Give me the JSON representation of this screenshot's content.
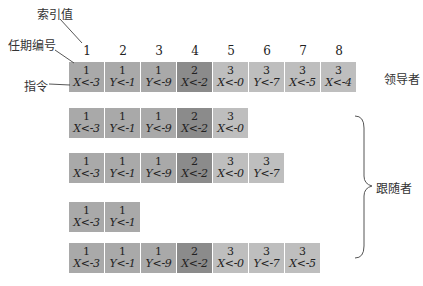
{
  "annotations": {
    "index_label": "索引值",
    "term_label": "任期编号",
    "command_label": "指令",
    "leader_label": "领导者",
    "followers_label": "跟随者"
  },
  "indices": [
    "1",
    "2",
    "3",
    "4",
    "5",
    "6",
    "7",
    "8"
  ],
  "term_colors": {
    "1": "#a9a9a9",
    "2": "#8b8b8b",
    "3": "#bebebe"
  },
  "logs": {
    "leader": [
      {
        "term": "1",
        "cmd": "X<-3"
      },
      {
        "term": "1",
        "cmd": "Y<-1"
      },
      {
        "term": "1",
        "cmd": "Y<-9"
      },
      {
        "term": "2",
        "cmd": "X<-2"
      },
      {
        "term": "3",
        "cmd": "X<-0"
      },
      {
        "term": "3",
        "cmd": "Y<-7"
      },
      {
        "term": "3",
        "cmd": "X<-5"
      },
      {
        "term": "3",
        "cmd": "X<-4"
      }
    ],
    "follower1": [
      {
        "term": "1",
        "cmd": "X<-3"
      },
      {
        "term": "1",
        "cmd": "Y<-1"
      },
      {
        "term": "1",
        "cmd": "Y<-9"
      },
      {
        "term": "2",
        "cmd": "X<-2"
      },
      {
        "term": "3",
        "cmd": "X<-0"
      }
    ],
    "follower2": [
      {
        "term": "1",
        "cmd": "X<-3"
      },
      {
        "term": "1",
        "cmd": "Y<-1"
      },
      {
        "term": "1",
        "cmd": "Y<-9"
      },
      {
        "term": "2",
        "cmd": "X<-2"
      },
      {
        "term": "3",
        "cmd": "X<-0"
      },
      {
        "term": "3",
        "cmd": "Y<-7"
      }
    ],
    "follower3": [
      {
        "term": "1",
        "cmd": "X<-3"
      },
      {
        "term": "1",
        "cmd": "Y<-1"
      }
    ],
    "follower4": [
      {
        "term": "1",
        "cmd": "X<-3"
      },
      {
        "term": "1",
        "cmd": "Y<-1"
      },
      {
        "term": "1",
        "cmd": "Y<-9"
      },
      {
        "term": "2",
        "cmd": "X<-2"
      },
      {
        "term": "3",
        "cmd": "X<-0"
      },
      {
        "term": "3",
        "cmd": "Y<-7"
      },
      {
        "term": "3",
        "cmd": "X<-5"
      }
    ]
  }
}
